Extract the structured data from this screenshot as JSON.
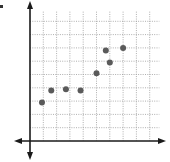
{
  "chart_data": {
    "type": "scatter",
    "title": "",
    "xlabel": "",
    "ylabel": "",
    "grid": true,
    "grid_style": "dotted",
    "axes": "cartesian with arrows in all four directions",
    "xlim": [
      0,
      9.5
    ],
    "ylim": [
      0,
      9.5
    ],
    "tick_labels": false,
    "points": [
      {
        "x": 0.9,
        "y": 2.9
      },
      {
        "x": 1.6,
        "y": 3.8
      },
      {
        "x": 2.7,
        "y": 3.9
      },
      {
        "x": 3.8,
        "y": 3.8
      },
      {
        "x": 5.0,
        "y": 5.1
      },
      {
        "x": 5.7,
        "y": 6.8
      },
      {
        "x": 6.0,
        "y": 5.9
      },
      {
        "x": 7.0,
        "y": 7.0
      }
    ],
    "marker_color": "#5a5a5a"
  },
  "colors": {
    "axis": "#1a1a1a",
    "grid": "#9a9a9a",
    "marker": "#5a5a5a",
    "background": "#ffffff"
  },
  "layout": {
    "origin_px": [
      30,
      141
    ],
    "unit_px": 13.3,
    "grid_cols": 10,
    "grid_rows": 10
  }
}
